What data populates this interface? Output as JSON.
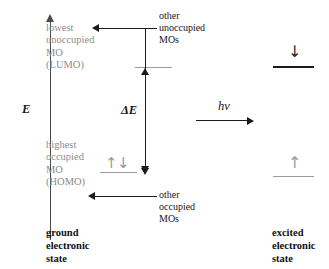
{
  "diagram": {
    "axis": {
      "label": "E"
    },
    "ground_state": {
      "lumo_label": "lowest\nunoccupied\nMO\n(LUMO)",
      "homo_label": "highest\noccupied\nMO\n(HOMO)",
      "homo_electrons": "↑↓",
      "caption": "ground\nelectronic\nstate"
    },
    "annotations": {
      "other_unoccupied": "other\nunoccupied\nMOs",
      "other_occupied": "other\noccupied\nMOs",
      "gap_label": "ΔE",
      "photon_label": "hν"
    },
    "excited_state": {
      "upper_electron": "↓",
      "lower_electron": "↑",
      "caption": "excited\nelectronic\nstate"
    },
    "colors": {
      "ink": "#17161a",
      "gray_text": "#8d8d8d",
      "gray_level": "#9b9b9b",
      "dark_level": "#1b1a1f",
      "axis": "#4a4a4a",
      "background": "#ffffff"
    }
  }
}
